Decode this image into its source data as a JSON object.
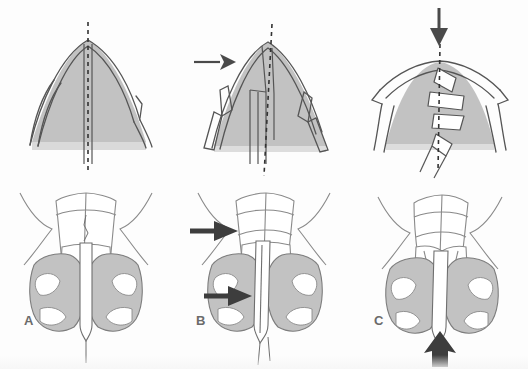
{
  "figure": {
    "kind": "medical-illustration",
    "rows": 2,
    "columns": 3,
    "width": 528,
    "height": 369,
    "background_color": "#fdfdfd"
  },
  "colors": {
    "cartilage_fill": "#c2c2c2",
    "cartilage_fill_light": "#d2d2d2",
    "bone_fill": "#ffffff",
    "outline": "#555555",
    "outline_soft": "#8a8a8a",
    "midline_dash": "#333333",
    "arrow": "#4a4a4a",
    "label_text": "#6b6b6b"
  },
  "panels": [
    {
      "id": "A",
      "label": "A",
      "label_x": 24,
      "label_y": 315,
      "top_view": {
        "name": "sagittal-schematic-normal",
        "description": "Intact arched septal cartilage with straight midline",
        "midline": "straight-dashed",
        "arrows": []
      },
      "bottom_view": {
        "name": "coronal-anatomy-normal",
        "description": "Frontal anatomic view, symmetric nasal vault",
        "arrows": []
      }
    },
    {
      "id": "B",
      "label": "B",
      "label_x": 196,
      "label_y": 315,
      "top_view": {
        "name": "sagittal-schematic-lateral-force",
        "description": "Lateral force deviates the arch, septum shifted, midline deviated",
        "midline": "deviated-dashed",
        "arrows": [
          {
            "name": "lateral-force-arrow",
            "direction": "right",
            "x": 196,
            "y": 62,
            "length": 32,
            "style": "thin"
          }
        ]
      },
      "bottom_view": {
        "name": "coronal-anatomy-lateral-force",
        "description": "Frontal view with two lateral impact arrows",
        "arrows": [
          {
            "name": "upper-lateral-force-arrow",
            "direction": "right",
            "x": 190,
            "y": 231,
            "length": 40,
            "style": "thick"
          },
          {
            "name": "lower-lateral-force-arrow",
            "direction": "right",
            "x": 204,
            "y": 296,
            "length": 40,
            "style": "thick"
          }
        ]
      }
    },
    {
      "id": "C",
      "label": "C",
      "label_x": 374,
      "label_y": 315,
      "top_view": {
        "name": "sagittal-schematic-axial-load",
        "description": "Axial downward load collapses arch; septal cartilage fractured into overlapping zig-zag segments",
        "midline": "buckled-dashed",
        "arrows": [
          {
            "name": "axial-load-arrow",
            "direction": "down",
            "x": 438,
            "y": 8,
            "length": 38,
            "style": "thick"
          }
        ]
      },
      "bottom_view": {
        "name": "coronal-anatomy-axial-load",
        "description": "Frontal view with upward caudal arrow at columella",
        "arrows": [
          {
            "name": "caudal-force-arrow",
            "direction": "up",
            "x": 441,
            "y": 330,
            "length": 28,
            "style": "thick"
          }
        ]
      }
    }
  ],
  "legend": {
    "shaded_region_meaning": "cartilage / soft tissue (gray shading)",
    "white_region_meaning": "bone (white)",
    "dashed_line_meaning": "midline axis"
  }
}
